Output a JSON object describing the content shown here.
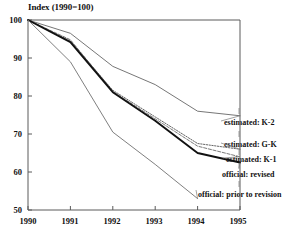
{
  "chart_data": {
    "type": "line",
    "title": "Index (1990=100)",
    "xlabel": "",
    "ylabel": "",
    "x": [
      1990,
      1991,
      1992,
      1993,
      1994,
      1995
    ],
    "xtick_labels": [
      "1990",
      "1991",
      "1992",
      "1993",
      "1994",
      "1995"
    ],
    "ytick_labels": [
      "100",
      "90",
      "80",
      "70",
      "60",
      "50"
    ],
    "ytick_values": [
      100,
      90,
      80,
      70,
      60,
      50
    ],
    "xlim": [
      1990,
      1995
    ],
    "ylim": [
      50,
      100
    ],
    "grid": false,
    "legend_position": "inline-right",
    "series": [
      {
        "name": "estimated: K-2",
        "label": "estimated: K-2",
        "color": "#666666",
        "style": "solid",
        "x": [
          1990,
          1991,
          1992,
          1993,
          1994,
          1995
        ],
        "values": [
          100,
          96.5,
          87.8,
          83.0,
          76.0,
          74.8
        ]
      },
      {
        "name": "estimated: G-K",
        "label": "estimated: G-K",
        "color": "#555555",
        "style": "dotted",
        "x": [
          1990,
          1991,
          1992,
          1993,
          1994,
          1995
        ],
        "values": [
          100,
          94.5,
          81.5,
          74.5,
          67.5,
          66.0
        ]
      },
      {
        "name": "estimated: K-1",
        "label": "estimated: K-1",
        "color": "#6b6b6b",
        "style": "dashed",
        "x": [
          1990,
          1991,
          1992,
          1993,
          1994,
          1995
        ],
        "values": [
          100,
          94.8,
          81.2,
          74.0,
          66.8,
          64.0
        ]
      },
      {
        "name": "official: revised",
        "label": "official: revised",
        "color": "#111111",
        "style": "solid-bold",
        "x": [
          1990,
          1991,
          1992,
          1993,
          1994,
          1995
        ],
        "values": [
          100,
          94.2,
          81.0,
          73.5,
          65.0,
          62.5
        ]
      },
      {
        "name": "official: prior to revision",
        "label": "official: prior to revision",
        "color": "#707070",
        "style": "solid",
        "x": [
          1990,
          1991,
          1992,
          1993,
          1994
        ],
        "values": [
          100,
          89.0,
          70.5,
          62.0,
          53.0
        ]
      }
    ]
  },
  "axis": {
    "title": "Index (1990=100)"
  }
}
